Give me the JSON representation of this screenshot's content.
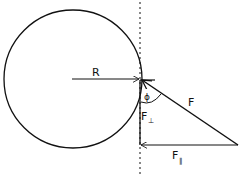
{
  "diagram": {
    "type": "torque force decomposition",
    "labels": {
      "radius": "R",
      "force": "F",
      "angle": "ϕ",
      "f_perp_main": "F",
      "f_perp_sub": "⊥",
      "f_par_main": "F",
      "f_par_sub": "‖"
    },
    "colors": {
      "stroke": "#111111",
      "background": "#ffffff"
    }
  }
}
